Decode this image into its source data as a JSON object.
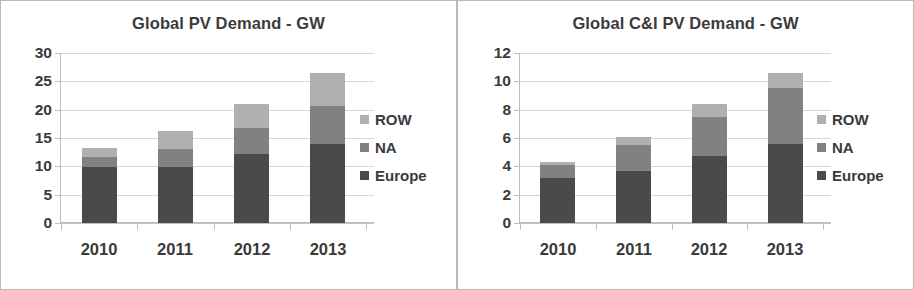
{
  "charts": [
    {
      "id": "global-pv-demand",
      "title": "Global PV Demand - GW",
      "legend": [
        {
          "name": "ROW",
          "color": "#b0b0b0"
        },
        {
          "name": "NA",
          "color": "#818181"
        },
        {
          "name": "Europe",
          "color": "#4a4a4a"
        }
      ]
    },
    {
      "id": "global-ci-pv-demand",
      "title": "Global C&I PV Demand - GW",
      "legend": [
        {
          "name": "ROW",
          "color": "#b0b0b0"
        },
        {
          "name": "NA",
          "color": "#818181"
        },
        {
          "name": "Europe",
          "color": "#4a4a4a"
        }
      ]
    }
  ],
  "chart_data": [
    {
      "type": "bar",
      "subtype": "stacked-vertical",
      "title": "Global PV Demand - GW",
      "xlabel": "",
      "ylabel": "",
      "unit": "GW",
      "categories": [
        "2010",
        "2011",
        "2012",
        "2013"
      ],
      "ylim": [
        0,
        30
      ],
      "yticks": [
        0,
        5,
        10,
        15,
        20,
        25,
        30
      ],
      "ytick_labels": [
        "0",
        "5",
        "10",
        "15",
        "20",
        "25",
        "30"
      ],
      "grid": true,
      "legend_position": "right",
      "series": [
        {
          "name": "Europe",
          "color": "#4a4a4a",
          "values": [
            9.8,
            9.8,
            12.1,
            14.0
          ]
        },
        {
          "name": "NA",
          "color": "#818181",
          "values": [
            1.9,
            3.2,
            4.6,
            6.6
          ]
        },
        {
          "name": "ROW",
          "color": "#b0b0b0",
          "values": [
            1.6,
            3.2,
            4.3,
            5.8
          ]
        }
      ],
      "totals": [
        13.3,
        16.2,
        21.0,
        26.4
      ]
    },
    {
      "type": "bar",
      "subtype": "stacked-vertical",
      "title": "Global C&I PV Demand - GW",
      "xlabel": "",
      "ylabel": "",
      "unit": "GW",
      "categories": [
        "2010",
        "2011",
        "2012",
        "2013"
      ],
      "ylim": [
        0,
        12
      ],
      "yticks": [
        0,
        2,
        4,
        6,
        8,
        10,
        12
      ],
      "ytick_labels": [
        "0",
        "2",
        "4",
        "6",
        "8",
        "10",
        "12"
      ],
      "grid": true,
      "legend_position": "right",
      "series": [
        {
          "name": "Europe",
          "color": "#4a4a4a",
          "values": [
            3.2,
            3.7,
            4.7,
            5.6
          ]
        },
        {
          "name": "NA",
          "color": "#818181",
          "values": [
            0.9,
            1.8,
            2.8,
            3.9
          ]
        },
        {
          "name": "ROW",
          "color": "#b0b0b0",
          "values": [
            0.2,
            0.6,
            0.9,
            1.1
          ]
        }
      ],
      "totals": [
        4.3,
        6.1,
        8.4,
        10.6
      ]
    }
  ]
}
